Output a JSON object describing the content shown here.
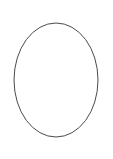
{
  "canvas": {
    "width": 113,
    "height": 159,
    "background_color": "#ffffff",
    "name": "drawing-canvas"
  },
  "figure": {
    "type": "ellipse-outline",
    "title": "",
    "caption": "",
    "shape_name": "ellipse",
    "center_x": 56,
    "center_y": 80,
    "radius_x": 42,
    "radius_y": 57,
    "stroke_color": "#4a4a50",
    "stroke_width": 1,
    "fill": "none",
    "fill_color": "#ffffff"
  }
}
